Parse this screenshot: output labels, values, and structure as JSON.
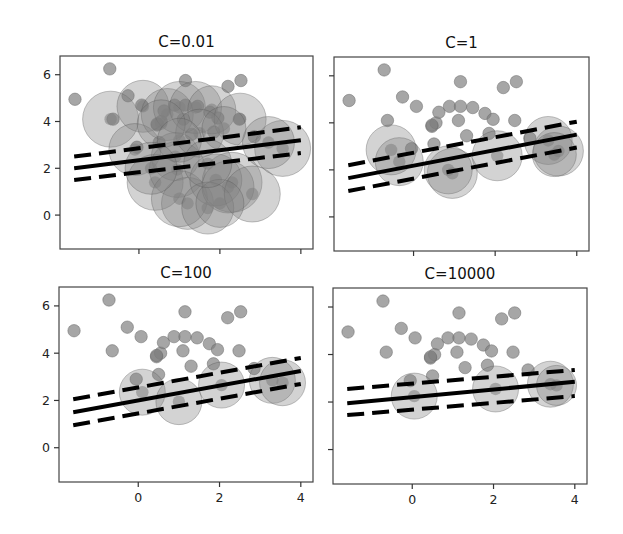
{
  "figure": {
    "width": 623,
    "height": 534,
    "background": "#ffffff"
  },
  "colors": {
    "point_fill": "#808080",
    "point_opacity": 0.7,
    "circle_fill": "#808080",
    "circle_opacity": 0.35,
    "line": "#000000",
    "frame": "#444444"
  },
  "chart_data": [
    {
      "type": "scatter",
      "title": "C=0.01",
      "panel": "top-left",
      "xlim": [
        -1.95,
        4.3
      ],
      "ylim": [
        -1.45,
        6.8
      ],
      "xticks": [
        0,
        2,
        4
      ],
      "xtick_labels_visible": false,
      "yticks": [
        0,
        2,
        4,
        6
      ],
      "ytick_labels_visible": true,
      "decision_line": {
        "x": [
          -1.6,
          4.0
        ],
        "y": [
          2.0,
          3.2
        ]
      },
      "margin_upper": {
        "x": [
          -1.6,
          4.0
        ],
        "y": [
          2.5,
          3.75
        ]
      },
      "margin_lower": {
        "x": [
          -1.6,
          4.0
        ],
        "y": [
          1.5,
          2.65
        ]
      },
      "support_vectors_many": true
    },
    {
      "type": "scatter",
      "title": "C=1",
      "panel": "top-right",
      "xlim": [
        -1.95,
        4.3
      ],
      "ylim": [
        -1.45,
        6.8
      ],
      "xticks": [
        0,
        2,
        4
      ],
      "xtick_labels_visible": false,
      "yticks": [
        0,
        2,
        4,
        6
      ],
      "ytick_labels_visible": false,
      "decision_line": {
        "x": [
          -1.6,
          4.0
        ],
        "y": [
          1.65,
          3.5
        ]
      },
      "margin_upper": {
        "x": [
          -1.6,
          4.0
        ],
        "y": [
          2.2,
          4.05
        ]
      },
      "margin_lower": {
        "x": [
          -1.6,
          4.0
        ],
        "y": [
          1.1,
          2.95
        ]
      }
    },
    {
      "type": "scatter",
      "title": "C=100",
      "panel": "bottom-left",
      "xlim": [
        -1.95,
        4.3
      ],
      "ylim": [
        -1.45,
        6.8
      ],
      "xticks": [
        0,
        2,
        4
      ],
      "xtick_labels_visible": true,
      "yticks": [
        0,
        2,
        4,
        6
      ],
      "ytick_labels_visible": true,
      "decision_line": {
        "x": [
          -1.6,
          4.0
        ],
        "y": [
          1.5,
          3.25
        ]
      },
      "margin_upper": {
        "x": [
          -1.6,
          4.0
        ],
        "y": [
          2.05,
          3.8
        ]
      },
      "margin_lower": {
        "x": [
          -1.6,
          4.0
        ],
        "y": [
          0.95,
          2.7
        ]
      }
    },
    {
      "type": "scatter",
      "title": "C=10000",
      "panel": "bottom-right",
      "xlim": [
        -1.95,
        4.3
      ],
      "ylim": [
        -1.45,
        6.8
      ],
      "xticks": [
        0,
        2,
        4
      ],
      "xtick_labels_visible": true,
      "yticks": [
        0,
        2,
        4,
        6
      ],
      "ytick_labels_visible": false,
      "decision_line": {
        "x": [
          -1.6,
          4.0
        ],
        "y": [
          1.95,
          2.85
        ]
      },
      "margin_upper": {
        "x": [
          -1.6,
          4.0
        ],
        "y": [
          2.55,
          3.35
        ]
      },
      "margin_lower": {
        "x": [
          -1.6,
          4.0
        ],
        "y": [
          1.45,
          2.25
        ]
      }
    }
  ],
  "points_upper_class": [
    [
      -1.58,
      4.95
    ],
    [
      -0.72,
      6.25
    ],
    [
      -0.64,
      4.1
    ],
    [
      -0.27,
      5.1
    ],
    [
      0.07,
      4.7
    ],
    [
      1.15,
      5.75
    ],
    [
      2.2,
      5.5
    ],
    [
      2.52,
      5.75
    ],
    [
      2.48,
      4.1
    ],
    [
      0.45,
      3.85
    ],
    [
      0.55,
      4.0
    ],
    [
      0.62,
      4.45
    ],
    [
      0.88,
      4.7
    ],
    [
      1.15,
      4.7
    ],
    [
      1.45,
      4.65
    ],
    [
      1.75,
      4.4
    ],
    [
      1.95,
      4.15
    ],
    [
      1.1,
      4.1
    ],
    [
      0.5,
      3.1
    ],
    [
      1.3,
      3.45
    ],
    [
      1.85,
      3.55
    ],
    [
      -0.05,
      2.9
    ],
    [
      2.85,
      3.35
    ],
    [
      0.45,
      3.9
    ]
  ],
  "support_circles": {
    "C=0.01": [
      [
        -0.7,
        4.1,
        28
      ],
      [
        0.1,
        4.65,
        26
      ],
      [
        -0.1,
        2.8,
        26
      ],
      [
        0.4,
        1.4,
        28
      ],
      [
        0.7,
        4.3,
        26
      ],
      [
        1.0,
        4.6,
        26
      ],
      [
        1.4,
        4.6,
        26
      ],
      [
        1.8,
        4.5,
        24
      ],
      [
        2.5,
        4.1,
        26
      ],
      [
        0.9,
        2.5,
        24
      ],
      [
        0.95,
        1.95,
        28
      ],
      [
        1.2,
        0.5,
        26
      ],
      [
        1.0,
        0.7,
        28
      ],
      [
        2.3,
        1.4,
        30
      ],
      [
        1.9,
        1.5,
        26
      ],
      [
        2.2,
        1.2,
        26
      ],
      [
        1.7,
        0.3,
        26
      ],
      [
        2.8,
        0.9,
        28
      ],
      [
        3.55,
        2.85,
        28
      ],
      [
        3.2,
        3.1,
        26
      ],
      [
        1.5,
        3.5,
        24
      ],
      [
        0.55,
        3.9,
        24
      ],
      [
        2.1,
        3.7,
        22
      ],
      [
        2.0,
        0.5,
        24
      ],
      [
        1.0,
        3.2,
        22
      ],
      [
        0.3,
        2.0,
        26
      ],
      [
        1.7,
        2.2,
        24
      ]
    ],
    "C=1": [
      [
        -0.55,
        2.85,
        25
      ],
      [
        -0.35,
        2.35,
        24
      ],
      [
        0.95,
        1.85,
        25
      ],
      [
        0.85,
        2.0,
        24
      ],
      [
        2.05,
        2.6,
        25
      ],
      [
        3.3,
        3.25,
        24
      ],
      [
        3.55,
        2.8,
        25
      ],
      [
        3.45,
        2.65,
        22
      ]
    ],
    "C=100": [
      [
        0.1,
        2.35,
        23
      ],
      [
        1.0,
        1.95,
        23
      ],
      [
        2.05,
        2.65,
        23
      ],
      [
        3.3,
        2.85,
        23
      ],
      [
        3.55,
        2.75,
        23
      ]
    ],
    "C=10000": [
      [
        0.05,
        2.25,
        23
      ],
      [
        2.05,
        2.55,
        23
      ],
      [
        3.4,
        2.75,
        23
      ],
      [
        3.55,
        2.7,
        20
      ]
    ]
  },
  "panels_px": [
    {
      "x0": 60,
      "y0": 56,
      "x1": 313,
      "y1": 249
    },
    {
      "x0": 334,
      "y0": 57,
      "x1": 589,
      "y1": 251
    },
    {
      "x0": 59,
      "y0": 287,
      "x1": 313,
      "y1": 482
    },
    {
      "x0": 333,
      "y0": 288,
      "x1": 587,
      "y1": 484
    }
  ]
}
